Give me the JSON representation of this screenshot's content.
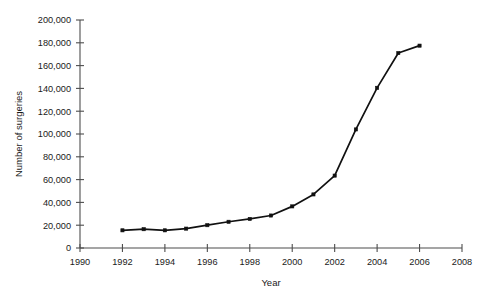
{
  "chart_data": {
    "type": "line",
    "title": "",
    "xlabel": "Year",
    "ylabel": "Number of surgeries",
    "xlim": [
      1990,
      2008
    ],
    "ylim": [
      0,
      200000
    ],
    "grid": false,
    "legend": null,
    "x": [
      1992,
      1993,
      1994,
      1995,
      1996,
      1997,
      1998,
      1999,
      2000,
      2001,
      2002,
      2003,
      2004,
      2005,
      2006
    ],
    "values": [
      15500,
      16500,
      15500,
      17000,
      20000,
      23000,
      25500,
      28500,
      36500,
      47000,
      63500,
      104000,
      140500,
      171000,
      177500
    ],
    "series": [
      {
        "name": "Number of surgeries",
        "values": [
          15500,
          16500,
          15500,
          17000,
          20000,
          23000,
          25500,
          28500,
          36500,
          47000,
          63500,
          104000,
          140500,
          171000,
          177500
        ]
      }
    ],
    "xticks": [
      1990,
      1992,
      1994,
      1996,
      1998,
      2000,
      2002,
      2004,
      2006,
      2008
    ],
    "xticklabels": [
      "1990",
      "1992",
      "1994",
      "1996",
      "1998",
      "2000",
      "2002",
      "2004",
      "2006",
      "2008"
    ],
    "yticks": [
      0,
      20000,
      40000,
      60000,
      80000,
      100000,
      120000,
      140000,
      160000,
      180000,
      200000
    ],
    "yticklabels": [
      "0",
      "20,000",
      "40,000",
      "60,000",
      "80,000",
      "100,000",
      "120,000",
      "140,000",
      "160,000",
      "180,000",
      "200,000"
    ],
    "line_color": "#111111",
    "marker": "square",
    "axis_color": "#4d4d4d",
    "background_color": "#ffffff"
  }
}
